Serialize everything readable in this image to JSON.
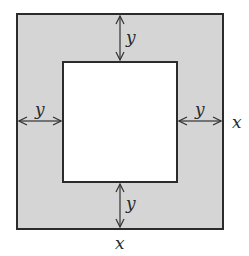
{
  "diagram": {
    "outer_square": {
      "side_label": "x",
      "fill": "#d5d5d5",
      "stroke": "#2b2b2b"
    },
    "inner_square": {
      "fill": "#ffffff",
      "stroke": "#2b2b2b"
    },
    "dimensions": {
      "top_gap": "y",
      "bottom_gap": "y",
      "left_gap": "y",
      "right_gap": "y",
      "outer_width": "x",
      "outer_height": "x"
    },
    "labels": {
      "top": "y",
      "bottom": "y",
      "left": "y",
      "right": "y",
      "side_right": "x",
      "side_bottom": "x"
    }
  }
}
